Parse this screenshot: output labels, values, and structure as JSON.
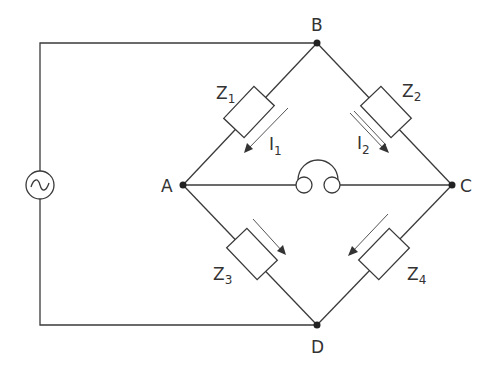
{
  "nodes": {
    "A": "A",
    "B": "B",
    "C": "C",
    "D": "D"
  },
  "impedances": [
    {
      "id": "Z1",
      "main": "Z",
      "sub": "1",
      "arm": "A-B"
    },
    {
      "id": "Z2",
      "main": "Z",
      "sub": "2",
      "arm": "B-C"
    },
    {
      "id": "Z3",
      "main": "Z",
      "sub": "3",
      "arm": "A-D"
    },
    {
      "id": "Z4",
      "main": "Z",
      "sub": "4",
      "arm": "C-D"
    }
  ],
  "currents": [
    {
      "id": "I1",
      "main": "I",
      "sub": "1"
    },
    {
      "id": "I2",
      "main": "I",
      "sub": "2"
    }
  ],
  "source": {
    "symbol": "~",
    "type": "ac-source-icon"
  },
  "detector": {
    "type": "headphones-icon",
    "between": "A-C"
  }
}
